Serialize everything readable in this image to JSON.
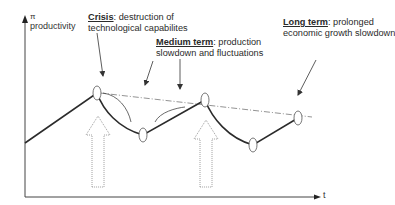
{
  "axes": {
    "y_symbol": "π",
    "y_label": "productivity",
    "x_label": "t"
  },
  "annotations": {
    "crisis": {
      "term": "Crisis",
      "sep": ": ",
      "line1_rest": "destruction of",
      "line2": "technological  capabilites"
    },
    "medium": {
      "term": "Medium term",
      "sep": ": ",
      "line1_rest": "production",
      "line2": "slowdown and fluctuations"
    },
    "long": {
      "term": "Long term",
      "sep": ": ",
      "line1_rest": "prolonged",
      "line2": "economic growth slowdown"
    }
  },
  "colors": {
    "curve": "#2b2b2b",
    "trend": "#666666",
    "arrow_outline": "#888888",
    "axis": "#444444"
  }
}
